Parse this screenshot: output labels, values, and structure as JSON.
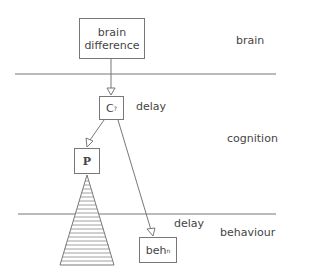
{
  "levels": {
    "brain": "brain",
    "cognition": "cognition",
    "behaviour": "behaviour"
  },
  "nodes": {
    "brain_difference": {
      "line1": "brain",
      "line2": "difference"
    },
    "cognition_node": {
      "main": "C",
      "sub": "?"
    },
    "p_node": {
      "main": "P"
    },
    "behaviour_node": {
      "main": "beh",
      "sub": "n"
    }
  },
  "annotations": {
    "delay_cognition": "delay",
    "delay_behaviour": "delay"
  }
}
